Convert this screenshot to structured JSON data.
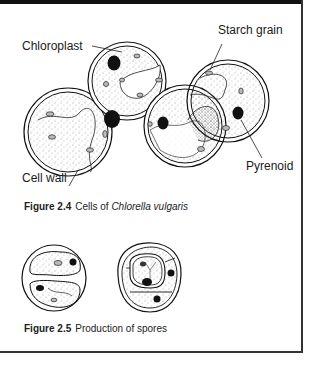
{
  "figure_2_4": {
    "labels": {
      "chloroplast": "Chloroplast",
      "starch_grain": "Starch grain",
      "pyrenoid": "Pyrenoid",
      "cell_wall": "Cell wall"
    },
    "caption": {
      "number": "Figure 2.4",
      "text": "Cells of ",
      "species": "Chlorella vulgaris"
    }
  },
  "figure_2_5": {
    "caption": {
      "number": "Figure 2.5",
      "text": "Production of spores"
    }
  },
  "colors": {
    "ink": "#111111",
    "frame": "#333333",
    "background": "#ffffff"
  }
}
